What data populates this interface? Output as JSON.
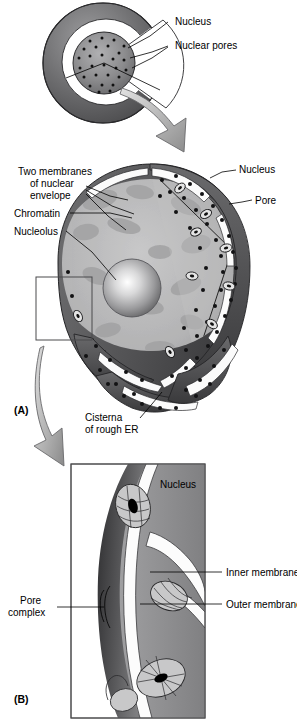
{
  "figure": {
    "panels": [
      {
        "id": "A",
        "marker": "(A)",
        "labels": [
          {
            "key": "nucleus_top",
            "text": "Nucleus"
          },
          {
            "key": "nuclear_pores_top",
            "text": "Nuclear pores"
          },
          {
            "key": "two_membranes_l1",
            "text": "Two membranes"
          },
          {
            "key": "two_membranes_l2",
            "text": "of nuclear"
          },
          {
            "key": "two_membranes_l3",
            "text": "envelope"
          },
          {
            "key": "chromatin",
            "text": "Chromatin"
          },
          {
            "key": "nucleolus",
            "text": "Nucleolus"
          },
          {
            "key": "nucleus_mid",
            "text": "Nucleus"
          },
          {
            "key": "pore",
            "text": "Pore"
          },
          {
            "key": "cisterna_l1",
            "text": "Cisterna"
          },
          {
            "key": "cisterna_l2",
            "text": "of rough ER"
          }
        ]
      },
      {
        "id": "B",
        "marker": "(B)",
        "labels": [
          {
            "key": "nucleus_b",
            "text": "Nucleus"
          },
          {
            "key": "inner_membrane",
            "text": "Inner membrane"
          },
          {
            "key": "outer_membrane",
            "text": "Outer membrane"
          },
          {
            "key": "pore_complex_l1",
            "text": "Pore"
          },
          {
            "key": "pore_complex_l2",
            "text": "complex"
          }
        ]
      }
    ],
    "colors": {
      "background": "#ffffff",
      "outline": "#1a1a1a",
      "cell_rim_dark": "#58585a",
      "cell_rim_light": "#9a9a9c",
      "cytoplasm_white": "#fdfdfd",
      "nucleus_top_fill": "#8e8e90",
      "nucleoplasm": "#b9b9ba",
      "chromatin_patch": "#a3a3a4",
      "nucleolus_core": "#ffffff",
      "nucleolus_edge": "#6e6e70",
      "envelope_dark": "#5a5a5c",
      "envelope_darker": "#3d3d3f",
      "cisterna_lumen": "#fbfbfb",
      "ribosome": "#151515",
      "pore_ring_light": "#e8e8e8",
      "arrow_fill_light": "#d2d2d2",
      "arrow_fill_dark": "#8d8d8d",
      "panelb_nucleus": "#8a8a8c",
      "panelb_nucleus_dark": "#4a4a4c",
      "panelb_envelope": "#3a3a3c",
      "pore_complex_fill": "#c6c6c7",
      "pore_complex_slit": "#000000",
      "box_stroke": "#4a4a4c"
    }
  }
}
